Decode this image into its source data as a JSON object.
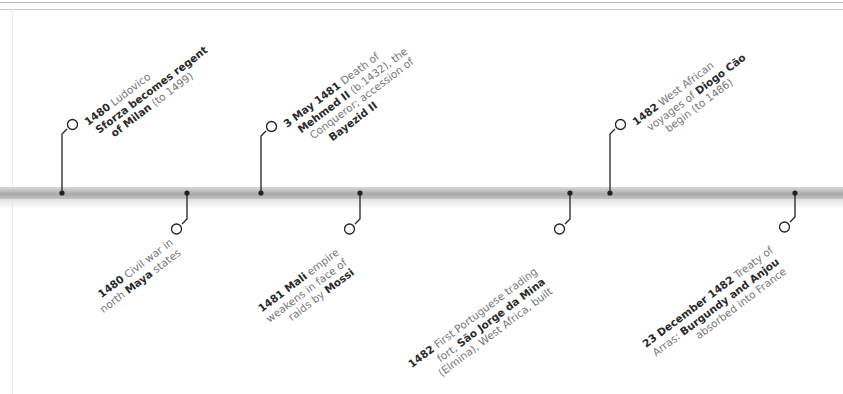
{
  "timeline": {
    "bar_color": "#b0b0b0",
    "line_color": "#222222",
    "events_above": [
      {
        "date": "1480",
        "dot_x": 62,
        "lines": [
          [
            {
              "b": "1480"
            },
            {
              "t": " Ludovico"
            }
          ],
          [
            {
              "b": "Sforza becomes regent"
            }
          ],
          [
            {
              "b": "of Milan"
            },
            {
              "t": " (to 1499)"
            }
          ]
        ]
      },
      {
        "date": "3 May 1481",
        "dot_x": 261,
        "lines": [
          [
            {
              "b": "3 May 1481"
            },
            {
              "t": " Death of"
            }
          ],
          [
            {
              "b": "Mehmed II"
            },
            {
              "t": " (b.1432), the"
            }
          ],
          [
            {
              "t": "Conqueror; accession of"
            }
          ],
          [
            {
              "b": "Bayezid II"
            }
          ]
        ]
      },
      {
        "date": "1482",
        "dot_x": 610,
        "lines": [
          [
            {
              "b": "1482"
            },
            {
              "t": "  West African"
            }
          ],
          [
            {
              "t": "voyages of "
            },
            {
              "b": "Diogo Cão"
            }
          ],
          [
            {
              "t": "begin (to 1486)"
            }
          ]
        ]
      }
    ],
    "events_below": [
      {
        "date": "1480",
        "dot_x": 187,
        "lines": [
          [
            {
              "b": "1480"
            },
            {
              "t": " Civil war in"
            }
          ],
          [
            {
              "t": "north "
            },
            {
              "b": "Maya"
            },
            {
              "t": " states"
            }
          ]
        ]
      },
      {
        "date": "1481",
        "dot_x": 360,
        "lines": [
          [
            {
              "b": "1481 Mali"
            },
            {
              "t": " empire"
            }
          ],
          [
            {
              "t": "weakens in face of"
            }
          ],
          [
            {
              "t": "raids by "
            },
            {
              "b": "Mossi"
            }
          ]
        ]
      },
      {
        "date": "1482",
        "dot_x": 570,
        "lines": [
          [
            {
              "b": "1482"
            },
            {
              "t": " First Portuguese trading"
            }
          ],
          [
            {
              "t": "fort, "
            },
            {
              "b": "São Jorge da Mina"
            }
          ],
          [
            {
              "t": "(Elmina), West Africa, built"
            }
          ]
        ]
      },
      {
        "date": "23 December 1482",
        "dot_x": 795,
        "lines": [
          [
            {
              "b": "23 December 1482"
            },
            {
              "t": " Treaty of"
            }
          ],
          [
            {
              "t": "Arras: "
            },
            {
              "b": "Burgundy and Anjou"
            }
          ],
          [
            {
              "t": "absorbed into France"
            }
          ]
        ]
      }
    ]
  }
}
